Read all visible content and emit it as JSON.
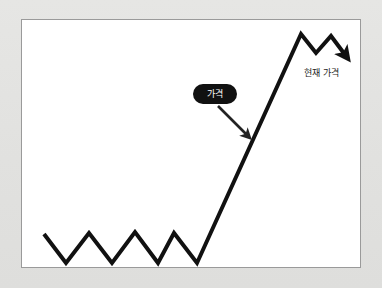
{
  "page": {
    "background_color": "#e3e3e1",
    "panel_background": "#ffffff",
    "panel_border_color": "#9a9a9a",
    "line_color": "#111111",
    "pill_color": "#111111",
    "pill_text_color": "#ffffff",
    "label_text_color": "#1c1c1c"
  },
  "annotations": {
    "price_pill_label": "가격",
    "current_price_label": "현재 가격"
  },
  "chart_data": {
    "type": "line",
    "title": "",
    "subtitle": "",
    "xlabel": "",
    "ylabel": "",
    "grid": false,
    "legend": "none",
    "axes_visible": false,
    "xlim": [
      0,
      340
    ],
    "ylim": [
      0,
      249
    ],
    "series": [
      {
        "name": "가격",
        "color": "#111111",
        "line_width": 4,
        "points": [
          [
            22,
            214
          ],
          [
            44,
            243
          ],
          [
            67,
            213
          ],
          [
            90,
            243
          ],
          [
            113,
            212
          ],
          [
            136,
            243
          ],
          [
            152,
            213
          ],
          [
            175,
            243
          ],
          [
            279,
            14
          ],
          [
            294,
            33
          ],
          [
            309,
            16
          ],
          [
            324,
            36
          ]
        ],
        "end_arrow": true
      }
    ],
    "annotations": [
      {
        "name": "price-callout",
        "text": "가격",
        "style": "black-rounded-pill-with-arrow",
        "pill_rect": [
          171,
          64,
          44,
          20
        ],
        "arrow_from": [
          196,
          86
        ],
        "arrow_to": [
          227,
          117
        ]
      },
      {
        "name": "current-price-label",
        "text": "현재 가격",
        "style": "plain-text",
        "position": [
          282,
          49
        ]
      }
    ]
  }
}
